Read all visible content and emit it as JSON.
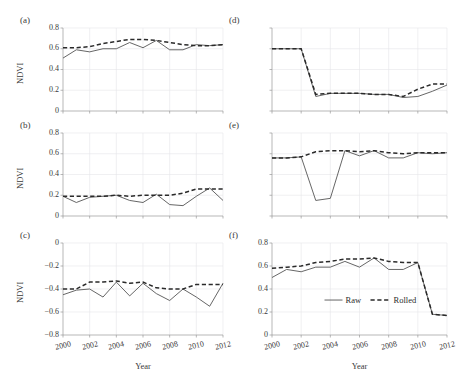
{
  "figure": {
    "axis_titles": {
      "y": "NDVI",
      "x": "Year"
    },
    "legend": {
      "raw_label": "Raw",
      "rolled_label": "Rolled"
    },
    "colors": {
      "raw": "#555555",
      "rolled": "#2a2a2a",
      "grid": "#e6e6ea",
      "axis": "#9a9a9a",
      "text": "#3a3a3a",
      "background": "#ffffff"
    }
  },
  "chart_data": [
    {
      "id": "a",
      "panel_label": "(a)",
      "type": "line",
      "title": "",
      "xlabel": "",
      "ylabel": "NDVI",
      "xlim": [
        2000,
        2012
      ],
      "ylim": [
        0,
        0.8
      ],
      "yticks": [
        0.8,
        0.6,
        0.4,
        0.2,
        0
      ],
      "ytick_labels": [
        "0.8",
        "0.6",
        "0.4",
        "0.2",
        "0"
      ],
      "xticks": [
        2000,
        2002,
        2004,
        2006,
        2008,
        2010,
        2012
      ],
      "xtick_labels": [
        "2000",
        "2002",
        "2004",
        "2006",
        "2008",
        "2010",
        "2012"
      ],
      "grid": true,
      "show_ytick_labels": true,
      "show_xtick_labels": false,
      "show_legend": false,
      "x": [
        2000,
        2001,
        2002,
        2003,
        2004,
        2005,
        2006,
        2007,
        2008,
        2009,
        2010,
        2011,
        2012
      ],
      "series": [
        {
          "name": "Raw",
          "style": "solid",
          "values": [
            0.51,
            0.59,
            0.57,
            0.6,
            0.6,
            0.66,
            0.61,
            0.68,
            0.59,
            0.59,
            0.64,
            0.63,
            0.64
          ]
        },
        {
          "name": "Rolled",
          "style": "dashed",
          "values": [
            0.61,
            0.61,
            0.62,
            0.65,
            0.67,
            0.69,
            0.69,
            0.68,
            0.66,
            0.64,
            0.63,
            0.63,
            0.64
          ]
        }
      ]
    },
    {
      "id": "b",
      "panel_label": "(b)",
      "type": "line",
      "title": "",
      "xlabel": "",
      "ylabel": "NDVI",
      "xlim": [
        2000,
        2012
      ],
      "ylim": [
        0,
        0.8
      ],
      "yticks": [
        0.8,
        0.6,
        0.4,
        0.2,
        0
      ],
      "ytick_labels": [
        "0.8",
        "0.6",
        "0.4",
        "0.2",
        "0"
      ],
      "xticks": [
        2000,
        2002,
        2004,
        2006,
        2008,
        2010,
        2012
      ],
      "xtick_labels": [
        "2000",
        "2002",
        "2004",
        "2006",
        "2008",
        "2010",
        "2012"
      ],
      "grid": true,
      "show_ytick_labels": true,
      "show_xtick_labels": false,
      "show_legend": false,
      "x": [
        2000,
        2001,
        2002,
        2003,
        2004,
        2005,
        2006,
        2007,
        2008,
        2009,
        2010,
        2011,
        2012
      ],
      "series": [
        {
          "name": "Raw",
          "style": "solid",
          "values": [
            0.19,
            0.13,
            0.18,
            0.19,
            0.2,
            0.15,
            0.13,
            0.21,
            0.11,
            0.1,
            0.19,
            0.27,
            0.15
          ]
        },
        {
          "name": "Rolled",
          "style": "dashed",
          "values": [
            0.19,
            0.19,
            0.19,
            0.19,
            0.2,
            0.19,
            0.2,
            0.2,
            0.2,
            0.22,
            0.26,
            0.26,
            0.26
          ]
        }
      ]
    },
    {
      "id": "c",
      "panel_label": "(c)",
      "type": "line",
      "title": "",
      "xlabel": "Year",
      "ylabel": "NDVI",
      "xlim": [
        2000,
        2012
      ],
      "ylim": [
        -0.8,
        0
      ],
      "yticks": [
        0,
        -0.2,
        -0.4,
        -0.6,
        -0.8
      ],
      "ytick_labels": [
        "0",
        "−0.2",
        "−0.4",
        "−0.6",
        "−0.8"
      ],
      "xticks": [
        2000,
        2002,
        2004,
        2006,
        2008,
        2010,
        2012
      ],
      "xtick_labels": [
        "2000",
        "2002",
        "2004",
        "2006",
        "2008",
        "2010",
        "2012"
      ],
      "grid": true,
      "show_ytick_labels": true,
      "show_xtick_labels": true,
      "show_legend": false,
      "x": [
        2000,
        2001,
        2002,
        2003,
        2004,
        2005,
        2006,
        2007,
        2008,
        2009,
        2010,
        2011,
        2012
      ],
      "series": [
        {
          "name": "Raw",
          "style": "solid",
          "values": [
            -0.45,
            -0.41,
            -0.4,
            -0.47,
            -0.34,
            -0.46,
            -0.35,
            -0.44,
            -0.5,
            -0.4,
            -0.47,
            -0.55,
            -0.35
          ]
        },
        {
          "name": "Rolled",
          "style": "dashed",
          "values": [
            -0.4,
            -0.4,
            -0.34,
            -0.34,
            -0.33,
            -0.35,
            -0.34,
            -0.39,
            -0.4,
            -0.4,
            -0.36,
            -0.36,
            -0.36
          ]
        }
      ]
    },
    {
      "id": "d",
      "panel_label": "(d)",
      "type": "line",
      "title": "",
      "xlabel": "",
      "ylabel": "",
      "xlim": [
        2000,
        2012
      ],
      "ylim": [
        0,
        0.8
      ],
      "yticks": [
        0.8,
        0.6,
        0.4,
        0.2,
        0
      ],
      "ytick_labels": [
        "0.8",
        "0.6",
        "0.4",
        "0.2",
        "0"
      ],
      "xticks": [
        2000,
        2002,
        2004,
        2006,
        2008,
        2010,
        2012
      ],
      "xtick_labels": [
        "2000",
        "2002",
        "2004",
        "2006",
        "2008",
        "2010",
        "2012"
      ],
      "grid": true,
      "show_ytick_labels": false,
      "show_xtick_labels": false,
      "show_legend": false,
      "x": [
        2000,
        2001,
        2002,
        2003,
        2004,
        2005,
        2006,
        2007,
        2008,
        2009,
        2010,
        2011,
        2012
      ],
      "series": [
        {
          "name": "Raw",
          "style": "solid",
          "values": [
            0.6,
            0.6,
            0.6,
            0.14,
            0.17,
            0.17,
            0.17,
            0.16,
            0.16,
            0.13,
            0.14,
            0.19,
            0.25
          ]
        },
        {
          "name": "Rolled",
          "style": "dashed",
          "values": [
            0.6,
            0.6,
            0.6,
            0.16,
            0.17,
            0.17,
            0.17,
            0.16,
            0.16,
            0.14,
            0.21,
            0.26,
            0.26
          ]
        }
      ]
    },
    {
      "id": "e",
      "panel_label": "(e)",
      "type": "line",
      "title": "",
      "xlabel": "",
      "ylabel": "",
      "xlim": [
        2000,
        2012
      ],
      "ylim": [
        0,
        0.8
      ],
      "yticks": [
        0.8,
        0.6,
        0.4,
        0.2,
        0
      ],
      "ytick_labels": [
        "0.8",
        "0.6",
        "0.4",
        "0.2",
        "0"
      ],
      "xticks": [
        2000,
        2002,
        2004,
        2006,
        2008,
        2010,
        2012
      ],
      "xtick_labels": [
        "2000",
        "2002",
        "2004",
        "2006",
        "2008",
        "2010",
        "2012"
      ],
      "grid": true,
      "show_ytick_labels": false,
      "show_xtick_labels": false,
      "show_legend": false,
      "x": [
        2000,
        2001,
        2002,
        2003,
        2004,
        2005,
        2006,
        2007,
        2008,
        2009,
        2010,
        2011,
        2012
      ],
      "series": [
        {
          "name": "Raw",
          "style": "solid",
          "values": [
            0.56,
            0.56,
            0.57,
            0.15,
            0.17,
            0.63,
            0.58,
            0.63,
            0.56,
            0.56,
            0.61,
            0.6,
            0.61
          ]
        },
        {
          "name": "Rolled",
          "style": "dashed",
          "values": [
            0.56,
            0.56,
            0.57,
            0.62,
            0.63,
            0.63,
            0.62,
            0.63,
            0.61,
            0.6,
            0.61,
            0.61,
            0.61
          ]
        }
      ]
    },
    {
      "id": "f",
      "panel_label": "(f)",
      "type": "line",
      "title": "",
      "xlabel": "Year",
      "ylabel": "",
      "xlim": [
        2000,
        2012
      ],
      "ylim": [
        0,
        0.8
      ],
      "yticks": [
        0.8,
        0.6,
        0.4,
        0.2,
        0
      ],
      "ytick_labels": [
        "0.8",
        "0.6",
        "0.4",
        "0.2",
        "0"
      ],
      "xticks": [
        2000,
        2002,
        2004,
        2006,
        2008,
        2010,
        2012
      ],
      "xtick_labels": [
        "2000",
        "2002",
        "2004",
        "2006",
        "2008",
        "2010",
        "2012"
      ],
      "grid": true,
      "show_ytick_labels": true,
      "show_xtick_labels": true,
      "show_legend": true,
      "x": [
        2000,
        2001,
        2002,
        2003,
        2004,
        2005,
        2006,
        2007,
        2008,
        2009,
        2010,
        2011,
        2012
      ],
      "series": [
        {
          "name": "Raw",
          "style": "solid",
          "values": [
            0.5,
            0.57,
            0.55,
            0.59,
            0.59,
            0.64,
            0.59,
            0.67,
            0.57,
            0.57,
            0.63,
            0.18,
            0.17
          ]
        },
        {
          "name": "Rolled",
          "style": "dashed",
          "values": [
            0.58,
            0.59,
            0.6,
            0.63,
            0.64,
            0.66,
            0.66,
            0.67,
            0.64,
            0.63,
            0.63,
            0.18,
            0.17
          ]
        }
      ]
    }
  ]
}
